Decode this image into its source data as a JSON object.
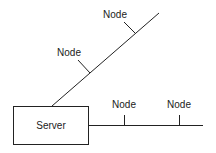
{
  "diagram": {
    "server": {
      "label": "Server"
    },
    "nodes": [
      {
        "label": "Node",
        "branch": "diagonal",
        "position": 1
      },
      {
        "label": "Node",
        "branch": "diagonal",
        "position": 2
      },
      {
        "label": "Node",
        "branch": "horizontal",
        "position": 1
      },
      {
        "label": "Node",
        "branch": "horizontal",
        "position": 2
      }
    ],
    "colors": {
      "line": "#222222",
      "background": "#ffffff"
    }
  }
}
